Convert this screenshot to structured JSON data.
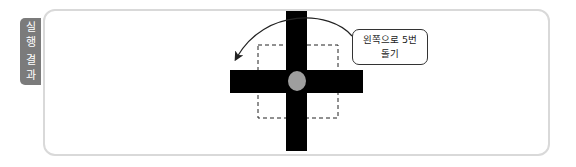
{
  "tab": {
    "label_chars": [
      "실",
      "행",
      "결",
      "과"
    ],
    "label": "실행결과",
    "color": "#7b7b7b"
  },
  "figure": {
    "shape": "cross",
    "center_marker": "gray-circle",
    "center_color": "#9e9e9e",
    "dashed_square": true,
    "arrow": "counterclockwise-arc-left"
  },
  "callout": {
    "line1": "왼쪽으로 5번",
    "line2": "돌기"
  }
}
